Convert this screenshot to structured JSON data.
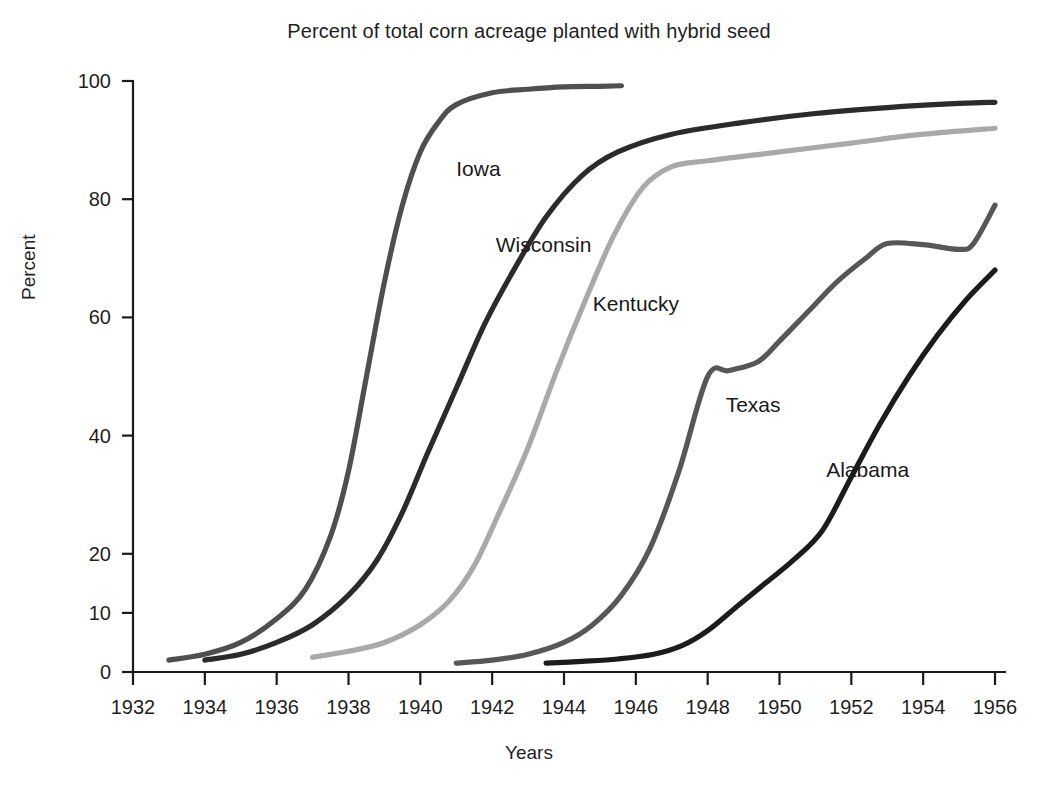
{
  "chart_data": {
    "type": "line",
    "title": "Percent of total corn acreage planted with hybrid seed",
    "xlabel": "Years",
    "ylabel": "Percent",
    "xlim": [
      1932,
      1956
    ],
    "ylim": [
      0,
      100
    ],
    "grid": false,
    "legend_position": "inline-labels",
    "x_ticks": [
      1932,
      1934,
      1936,
      1938,
      1940,
      1942,
      1944,
      1946,
      1948,
      1950,
      1952,
      1954,
      1956
    ],
    "y_ticks": [
      0,
      10,
      20,
      40,
      60,
      80,
      100
    ],
    "series": [
      {
        "name": "Iowa",
        "color": "#4f4f4f",
        "label_x": 1941.0,
        "label_y": 84,
        "x": [
          1933.0,
          1934.0,
          1935.0,
          1936.0,
          1936.8,
          1937.5,
          1938.0,
          1938.5,
          1939.0,
          1939.5,
          1940.0,
          1940.5,
          1941.0,
          1942.0,
          1943.0,
          1944.0,
          1945.0,
          1945.6
        ],
        "y": [
          2,
          3,
          5,
          9,
          14,
          23,
          34,
          50,
          66,
          79,
          88,
          93,
          96,
          98,
          98.6,
          99,
          99.1,
          99.2
        ]
      },
      {
        "name": "Wisconsin",
        "color": "#2b2b2b",
        "label_x": 1942.1,
        "label_y": 71,
        "x": [
          1934.0,
          1935.0,
          1936.0,
          1937.0,
          1938.0,
          1938.8,
          1939.5,
          1940.2,
          1941.0,
          1941.8,
          1942.6,
          1943.5,
          1944.5,
          1945.5,
          1947.0,
          1949.0,
          1951.0,
          1953.0,
          1955.0,
          1956.0
        ],
        "y": [
          2,
          3,
          5,
          8,
          13,
          19,
          27,
          37,
          48,
          59,
          68,
          77,
          84,
          88,
          91,
          93,
          94.5,
          95.5,
          96.2,
          96.4
        ]
      },
      {
        "name": "Kentucky",
        "color": "#a9a9a9",
        "label_x": 1944.8,
        "label_y": 61,
        "x": [
          1937.0,
          1938.0,
          1939.0,
          1940.0,
          1940.8,
          1941.5,
          1942.2,
          1943.0,
          1943.8,
          1944.6,
          1945.4,
          1946.2,
          1947.0,
          1948.0,
          1950.0,
          1952.0,
          1954.0,
          1956.0
        ],
        "y": [
          2.5,
          3.5,
          5,
          8,
          12,
          18,
          27,
          38,
          51,
          63,
          74,
          82,
          85.5,
          86.5,
          88,
          89.5,
          91,
          92
        ]
      },
      {
        "name": "Texas",
        "color": "#575757",
        "label_x": 1948.5,
        "label_y": 44,
        "x": [
          1941.0,
          1942.0,
          1943.0,
          1944.0,
          1944.8,
          1945.6,
          1946.4,
          1947.2,
          1948.0,
          1948.6,
          1949.4,
          1950.0,
          1950.8,
          1951.6,
          1952.4,
          1953.0,
          1954.0,
          1955.0,
          1955.4,
          1956.0
        ],
        "y": [
          1.5,
          2,
          3,
          5,
          8,
          13,
          21,
          34,
          50,
          51,
          52.5,
          56,
          61,
          66,
          70,
          72.5,
          72.3,
          71.5,
          72.5,
          79
        ]
      },
      {
        "name": "Alabama",
        "color": "#1c1c1c",
        "label_x": 1951.3,
        "label_y": 33,
        "x": [
          1943.5,
          1944.5,
          1945.5,
          1946.5,
          1947.3,
          1948.0,
          1948.8,
          1949.6,
          1950.4,
          1951.2,
          1952.0,
          1952.8,
          1953.6,
          1954.4,
          1955.2,
          1956.0
        ],
        "y": [
          1.5,
          1.8,
          2.2,
          3,
          4.5,
          7,
          11,
          15,
          19,
          24,
          33,
          42,
          50,
          57,
          63,
          68
        ]
      }
    ]
  }
}
